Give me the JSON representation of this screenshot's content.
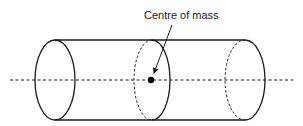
{
  "diagram": {
    "type": "cylinder-centre-of-mass",
    "label": "Centre of mass",
    "colors": {
      "stroke": "#1a1a1a",
      "background": "#ffffff"
    },
    "elements": [
      "left end face (solid ellipse)",
      "middle cross-section (dashed back half, solid front half)",
      "right end face (dashed back half, solid front half)",
      "dashed central axis",
      "centre of mass dot",
      "arrow from label to dot"
    ]
  }
}
